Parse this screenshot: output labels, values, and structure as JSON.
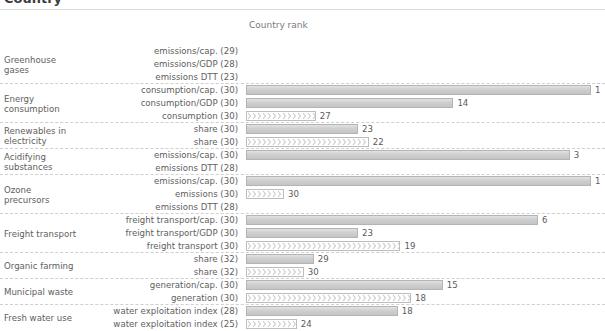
{
  "page": {
    "title_partial": "Country",
    "axis_title": "Country rank"
  },
  "chart_data": {
    "type": "bar",
    "title": "Country rank",
    "xlabel": "Country rank",
    "ylabel": "",
    "orientation": "horizontal",
    "grid": false,
    "legend": null,
    "note": "Bar length is inverse to rank: rank 1 is longest. Value label shown at bar end is the country rank. Number in parentheses after each indicator name is the number of countries compared. Rows with no bar have no rank displayed.",
    "groups": [
      {
        "group": "Greenhouse gases",
        "group_lines": [
          "Greenhouse",
          "gases"
        ],
        "rows": [
          {
            "indicator": "emissions/cap. (29)",
            "n": 29,
            "rank": null,
            "style": "solid"
          },
          {
            "indicator": "emissions/GDP (28)",
            "n": 28,
            "rank": null,
            "style": "solid"
          },
          {
            "indicator": "emissions DTT (23)",
            "n": 23,
            "rank": null,
            "style": "hatch"
          }
        ]
      },
      {
        "group": "Energy consumption",
        "group_lines": [
          "Energy",
          "consumption"
        ],
        "rows": [
          {
            "indicator": "consumption/cap. (30)",
            "n": 30,
            "rank": 1,
            "style": "solid"
          },
          {
            "indicator": "consumption/GDP (30)",
            "n": 30,
            "rank": 14,
            "style": "solid"
          },
          {
            "indicator": "consumption (30)",
            "n": 30,
            "rank": 27,
            "style": "hatch"
          }
        ]
      },
      {
        "group": "Renewables in electricity",
        "group_lines": [
          "Renewables in",
          "electricity"
        ],
        "rows": [
          {
            "indicator": "share (30)",
            "n": 30,
            "rank": 23,
            "style": "solid"
          },
          {
            "indicator": "share (30)",
            "n": 30,
            "rank": 22,
            "style": "hatch"
          }
        ]
      },
      {
        "group": "Acidifying substances",
        "group_lines": [
          "Acidifying",
          "substances"
        ],
        "rows": [
          {
            "indicator": "emissions/cap. (30)",
            "n": 30,
            "rank": 3,
            "style": "solid"
          },
          {
            "indicator": "emissions DTT (28)",
            "n": 28,
            "rank": null,
            "style": "hatch"
          }
        ]
      },
      {
        "group": "Ozone precursors",
        "group_lines": [
          "Ozone",
          "precursors"
        ],
        "rows": [
          {
            "indicator": "emissions/cap. (30)",
            "n": 30,
            "rank": 1,
            "style": "solid"
          },
          {
            "indicator": "emissions (30)",
            "n": 30,
            "rank": 30,
            "style": "hatch"
          },
          {
            "indicator": "emissions DTT (28)",
            "n": 28,
            "rank": null,
            "style": "hatch"
          }
        ]
      },
      {
        "group": "Freight transport",
        "group_lines": [
          "Freight transport"
        ],
        "rows": [
          {
            "indicator": "freight transport/cap. (30)",
            "n": 30,
            "rank": 6,
            "style": "solid"
          },
          {
            "indicator": "freight transport/GDP (30)",
            "n": 30,
            "rank": 23,
            "style": "solid"
          },
          {
            "indicator": "freight transport (30)",
            "n": 30,
            "rank": 19,
            "style": "hatch"
          }
        ]
      },
      {
        "group": "Organic farming",
        "group_lines": [
          "Organic farming"
        ],
        "rows": [
          {
            "indicator": "share (32)",
            "n": 32,
            "rank": 29,
            "style": "solid"
          },
          {
            "indicator": "share (32)",
            "n": 32,
            "rank": 30,
            "style": "hatch"
          }
        ]
      },
      {
        "group": "Municipal waste",
        "group_lines": [
          "Municipal waste"
        ],
        "rows": [
          {
            "indicator": "generation/cap. (30)",
            "n": 30,
            "rank": 15,
            "style": "solid"
          },
          {
            "indicator": "generation (30)",
            "n": 30,
            "rank": 18,
            "style": "hatch"
          }
        ]
      },
      {
        "group": "Fresh water use",
        "group_lines": [
          "Fresh water use"
        ],
        "rows": [
          {
            "indicator": "water exploitation index (28)",
            "n": 28,
            "rank": 18,
            "style": "solid"
          },
          {
            "indicator": "water exploitation index (25)",
            "n": 25,
            "rank": 24,
            "style": "hatch"
          }
        ]
      }
    ]
  }
}
